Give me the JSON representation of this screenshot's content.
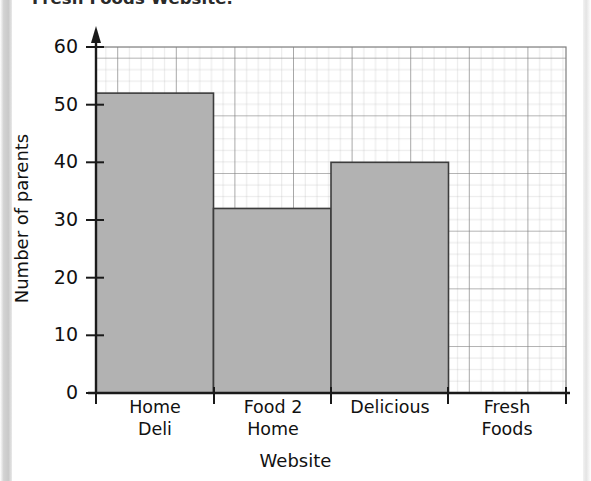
{
  "title": "Fresh Foods Website.",
  "axes": {
    "ylabel": "Number of parents",
    "xlabel": "Website",
    "yticks": [
      "0",
      "10",
      "20",
      "30",
      "40",
      "50",
      "60"
    ]
  },
  "categories": [
    {
      "line1": "Home",
      "line2": "Deli"
    },
    {
      "line1": "Food 2",
      "line2": "Home"
    },
    {
      "line1": "Delicious",
      "line2": ""
    },
    {
      "line1": "Fresh",
      "line2": "Foods"
    }
  ],
  "colors": {
    "bar_fill": "#b2b2b2",
    "bar_stroke": "#3c3c3c",
    "axis": "#1a1a1a",
    "grid_minor": "#b9b9b9",
    "grid_major": "#7a7a7a",
    "page_gutter": "#cbcbcb"
  },
  "chart_data": {
    "type": "bar",
    "title": "Fresh Foods Website.",
    "xlabel": "Website",
    "ylabel": "Number of parents",
    "categories": [
      "Home Deli",
      "Food 2 Home",
      "Delicious",
      "Fresh Foods"
    ],
    "values": [
      52,
      32,
      40,
      null
    ],
    "ylim": [
      0,
      60
    ],
    "ytick_step": 10,
    "grid": "on",
    "grid_minor_step": 2,
    "legend": "none"
  }
}
